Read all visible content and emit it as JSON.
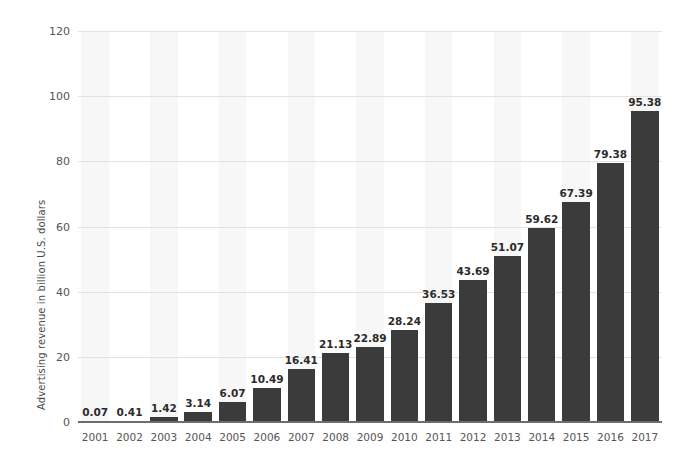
{
  "chart_data": {
    "type": "bar",
    "title": "",
    "subtitle": "",
    "xlabel": "",
    "ylabel": "Advertising revenue in billion U.S. dollars",
    "categories": [
      "2001",
      "2002",
      "2003",
      "2004",
      "2005",
      "2006",
      "2007",
      "2008",
      "2009",
      "2010",
      "2011",
      "2012",
      "2013",
      "2014",
      "2015",
      "2016",
      "2017"
    ],
    "values": [
      0.07,
      0.41,
      1.42,
      3.14,
      6.07,
      10.49,
      16.41,
      21.13,
      22.89,
      28.24,
      36.53,
      43.69,
      51.07,
      59.62,
      67.39,
      79.38,
      95.38
    ],
    "value_labels": [
      "0.07",
      "0.41",
      "1.42",
      "3.14",
      "6.07",
      "10.49",
      "16.41",
      "21.13",
      "22.89",
      "28.24",
      "36.53",
      "43.69",
      "51.07",
      "59.62",
      "67.39",
      "79.38",
      "95.38"
    ],
    "ylim": [
      0,
      120
    ],
    "ytick_values": [
      0,
      20,
      40,
      60,
      80,
      100,
      120
    ],
    "ytick_labels": [
      "0",
      "20",
      "40",
      "60",
      "80",
      "100",
      "120"
    ],
    "grid": true,
    "legend": false,
    "legend_position": "none",
    "colors": {
      "bar": "#3b3b3b",
      "gridline": "#e2e2e2",
      "band": "#f7f7f7",
      "axis_line": "#6d6d6d",
      "tick_label": "#555555",
      "value_label": "#2b2b2b",
      "axis_title": "#4a4a4a",
      "background": "#ffffff"
    }
  }
}
